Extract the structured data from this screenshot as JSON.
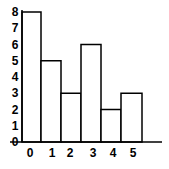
{
  "chart_data": {
    "type": "bar",
    "title": "",
    "xlabel": "",
    "ylabel": "",
    "categories": [
      "0",
      "1",
      "2",
      "3",
      "4",
      "5"
    ],
    "values": [
      8,
      5,
      3,
      6,
      2,
      3
    ],
    "ylim": [
      0,
      8
    ],
    "yticks": [
      "0",
      "1",
      "2",
      "3",
      "4",
      "5",
      "6",
      "7",
      "8"
    ],
    "grid": false,
    "legend": null,
    "bar_fill": "#ffffff",
    "bar_stroke": "#000000"
  }
}
